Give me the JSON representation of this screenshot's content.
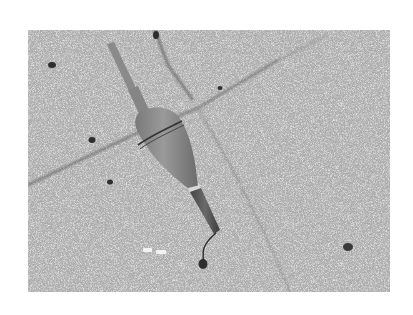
{
  "image": {
    "description": "Grayscale photograph of a fishing float (bobber) lying diagonally on speckled granite paving tiles with grout lines",
    "alt_text": "Fishing float on granite paving stones",
    "palette": {
      "background": "#ffffff",
      "stone_base": "#a9a9a9",
      "grout": "#6e6e6e",
      "float_body": "#8a8a8a",
      "float_highlight": "#9c9c9c",
      "float_band": "#3a3a3a",
      "stem_dark": "#505050"
    },
    "frame": {
      "x": 28,
      "y": 30,
      "width": 362,
      "height": 262
    }
  }
}
